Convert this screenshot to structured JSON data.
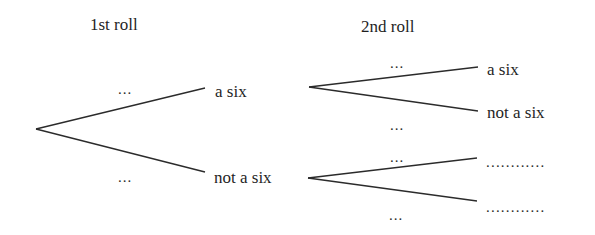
{
  "headings": {
    "first_roll": "1st roll",
    "second_roll": "2nd roll"
  },
  "first_roll": {
    "branches": [
      {
        "outcome": "a six",
        "probability": "…"
      },
      {
        "outcome": "not a six",
        "probability": "…"
      }
    ]
  },
  "second_roll": {
    "after_six": {
      "branches": [
        {
          "outcome": "a six",
          "probability": "…"
        },
        {
          "outcome": "not a six",
          "probability": "…"
        }
      ]
    },
    "after_not_six": {
      "branches": [
        {
          "outcome": "…………",
          "probability": "…"
        },
        {
          "outcome": "…………",
          "probability": "…"
        }
      ]
    }
  },
  "placeholders": {
    "ellipsis": "...",
    "blank": "............"
  },
  "geometry": {
    "root": [
      36,
      129
    ],
    "first_upper_end": [
      205,
      88
    ],
    "first_lower_end": [
      205,
      172
    ],
    "second_upper_origin": [
      309,
      87
    ],
    "second_upper_a_end": [
      478,
      67
    ],
    "second_upper_b_end": [
      478,
      111
    ],
    "second_lower_origin": [
      308,
      178
    ],
    "second_lower_a_end": [
      477,
      158
    ],
    "second_lower_b_end": [
      477,
      201
    ]
  },
  "style": {
    "line_color": "#2b2b2b",
    "text_color": "#1f1f1f",
    "background": "#ffffff"
  }
}
